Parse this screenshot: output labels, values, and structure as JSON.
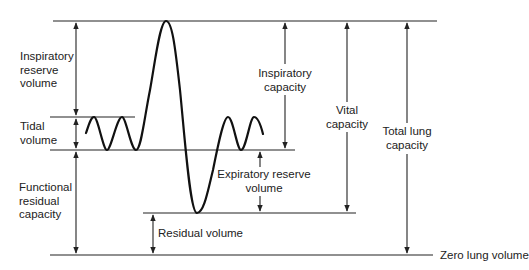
{
  "diagram": {
    "colors": {
      "line": "#222222",
      "background": "#ffffff"
    },
    "reference_levels": {
      "max_inspiration_y": 21,
      "end_tidal_inspiration_y": 117,
      "end_tidal_expiration_y": 150,
      "max_expiration_y": 213,
      "zero_volume_y": 255
    },
    "labels": {
      "irv": [
        "Inspiratory",
        "reserve",
        "volume"
      ],
      "tidal": [
        "Tidal",
        "volume"
      ],
      "frc": [
        "Functional",
        "residual",
        "capacity"
      ],
      "ic": [
        "Inspiratory",
        "capacity"
      ],
      "erv": [
        "Expiratory reserve",
        "volume"
      ],
      "vc": [
        "Vital",
        "capacity"
      ],
      "tlc": [
        "Total lung",
        "capacity"
      ],
      "rv": "Residual volume",
      "zero": "Zero lung volume"
    }
  }
}
